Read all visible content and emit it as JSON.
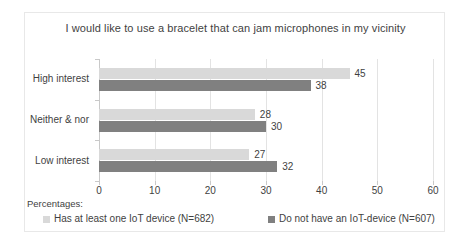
{
  "chart_data": {
    "type": "bar",
    "orientation": "horizontal",
    "title": "I would like to use a bracelet that can jam microphones in my vicinity",
    "xlabel": "",
    "ylabel": "",
    "xlim": [
      0,
      60
    ],
    "xticks": [
      0,
      10,
      20,
      30,
      40,
      50,
      60
    ],
    "grid": true,
    "legend_position": "bottom",
    "legend_prefix": "Percentages:",
    "categories": [
      "High interest",
      "Neither & nor",
      "Low interest"
    ],
    "series": [
      {
        "name": "Has at least one IoT device (N=682)",
        "color": "#d9d9d9",
        "values": [
          45,
          28,
          27
        ]
      },
      {
        "name": "Do not have an IoT-device (N=607)",
        "color": "#808080",
        "values": [
          38,
          30,
          32
        ]
      }
    ]
  }
}
